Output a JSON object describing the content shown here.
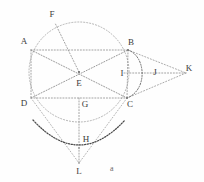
{
  "figure": {
    "caption": "a",
    "canvas": {
      "width": 204,
      "height": 182
    },
    "stroke_color": "#8c8c8c",
    "stroke_color_dark": "#4a4a4a",
    "label_color": "#3b3b3b",
    "background": "#fefefe"
  },
  "points": [
    {
      "id": "A",
      "label": "A",
      "x": 31,
      "y": 50,
      "label_x": 24,
      "label_y": 41
    },
    {
      "id": "B",
      "label": "B",
      "x": 128,
      "y": 50,
      "label_x": 131,
      "label_y": 42
    },
    {
      "id": "C",
      "label": "C",
      "x": 127,
      "y": 98,
      "label_x": 130,
      "label_y": 104
    },
    {
      "id": "D",
      "label": "D",
      "x": 31,
      "y": 98,
      "label_x": 24,
      "label_y": 103
    },
    {
      "id": "E",
      "label": "E",
      "x": 79,
      "y": 72,
      "label_x": 79,
      "label_y": 83
    },
    {
      "id": "F",
      "label": "F",
      "x": 55,
      "y": 23,
      "label_x": 52,
      "label_y": 14
    },
    {
      "id": "G",
      "label": "G",
      "x": 79,
      "y": 98,
      "label_x": 85,
      "label_y": 104
    },
    {
      "id": "H",
      "label": "H",
      "x": 79,
      "y": 148,
      "label_x": 86,
      "label_y": 139
    },
    {
      "id": "I",
      "label": "I",
      "x": 128,
      "y": 73,
      "label_x": 122,
      "label_y": 73
    },
    {
      "id": "J",
      "label": "J",
      "x": 150,
      "y": 73,
      "label_x": 155,
      "label_y": 72
    },
    {
      "id": "K",
      "label": "K",
      "x": 186,
      "y": 73,
      "label_x": 189,
      "label_y": 68
    },
    {
      "id": "L",
      "label": "L",
      "x": 79,
      "y": 163,
      "label_x": 79,
      "label_y": 171
    }
  ],
  "segments": [
    {
      "id": "AB",
      "from": "A",
      "to": "B",
      "style": "dotted"
    },
    {
      "id": "DC",
      "from": "D",
      "to": "C",
      "style": "dotted"
    },
    {
      "id": "AD",
      "from": "A",
      "to": "D",
      "style": "dotted"
    },
    {
      "id": "BC",
      "from": "B",
      "to": "C",
      "style": "dotted"
    },
    {
      "id": "AC",
      "from": "A",
      "to": "C",
      "style": "dotted"
    },
    {
      "id": "DB",
      "from": "D",
      "to": "B",
      "style": "dotted"
    },
    {
      "id": "EF",
      "from": "E",
      "to": "F",
      "style": "dotted"
    },
    {
      "id": "GL",
      "from": "G",
      "to": "L",
      "style": "dotted"
    },
    {
      "id": "IK",
      "from": "I",
      "to": "K",
      "style": "dotted"
    },
    {
      "id": "BK",
      "from": "B",
      "to": "K",
      "style": "dotted"
    },
    {
      "id": "CK",
      "from": "C",
      "to": "K",
      "style": "dotted"
    },
    {
      "id": "DL",
      "from": "D",
      "to": "L",
      "style": "dotted"
    },
    {
      "id": "CL",
      "from": "C",
      "to": "L",
      "style": "dotted"
    }
  ],
  "circles": [
    {
      "id": "main-circle",
      "cx": 79,
      "cy": 72,
      "r": 50,
      "style": "dotted",
      "weight": "light"
    }
  ],
  "arcs": [
    {
      "id": "arc-B-J-C",
      "from": "B",
      "to": "C",
      "through": "J",
      "style": "dotted",
      "weight": "medium"
    },
    {
      "id": "arc-D-H-C",
      "from": "D",
      "to": "C",
      "through": "H",
      "style": "dotted",
      "weight": "bold"
    }
  ],
  "caption_label": {
    "text": "a",
    "x": 112,
    "y": 168
  }
}
